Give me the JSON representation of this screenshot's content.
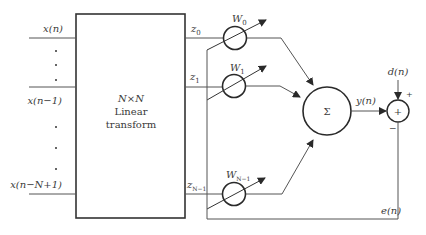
{
  "diagram": {
    "inputs": [
      {
        "label": "x(n)",
        "y": 38
      },
      {
        "label": "x(n−1)",
        "y": 87
      },
      {
        "label": "x(n−N+1)",
        "y": 194
      }
    ],
    "transform": {
      "line1": "N×N",
      "line2": "Linear",
      "line3": "transform"
    },
    "outputs": [
      {
        "label": "z",
        "sub": "0"
      },
      {
        "label": "z",
        "sub": "1"
      },
      {
        "label": "z",
        "sub": "N−1"
      }
    ],
    "weights": [
      {
        "label": "W",
        "sub": "0"
      },
      {
        "label": "W",
        "sub": "1"
      },
      {
        "label": "W",
        "sub": "N−1"
      }
    ],
    "summer": {
      "symbol": "Σ"
    },
    "output_signal": "y(n)",
    "desired_signal": "d(n)",
    "error_signal": "e(n)",
    "comparator": {
      "symbol": "+",
      "plus_sign": "+",
      "minus_sign": "−"
    },
    "colors": {
      "line": "#4a4a4a",
      "stroke_dark": "#2a2a2a"
    }
  }
}
